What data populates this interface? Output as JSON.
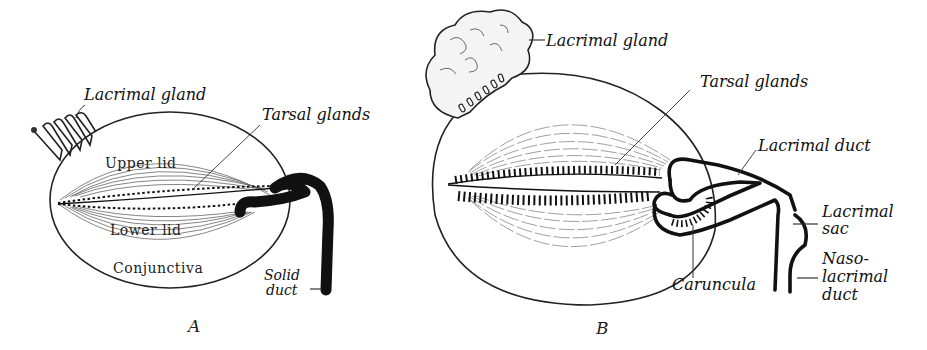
{
  "figure": {
    "panel_a": {
      "caption": "A",
      "labels": {
        "lacrimal_gland": "Lacrimal gland",
        "tarsal_glands": "Tarsal glands",
        "upper_lid": "Upper lid",
        "lower_lid": "Lower lid",
        "conjunctiva": "Conjunctiva",
        "solid_duct_1": "Solid",
        "solid_duct_2": "duct"
      }
    },
    "panel_b": {
      "caption": "B",
      "labels": {
        "lacrimal_gland": "Lacrimal gland",
        "tarsal_glands": "Tarsal glands",
        "lacrimal_duct": "Lacrimal duct",
        "lacrimal_sac_1": "Lacrimal",
        "lacrimal_sac_2": "sac",
        "nasolacrimal_1": "Naso-",
        "nasolacrimal_2": "lacrimal",
        "nasolacrimal_3": "duct",
        "caruncula": "Caruncula"
      }
    }
  }
}
